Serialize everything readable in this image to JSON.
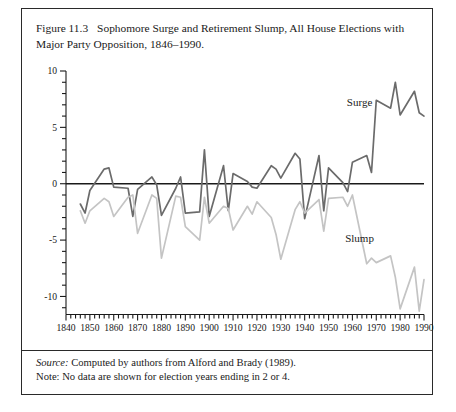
{
  "figure": {
    "number": "Figure 11.3",
    "caption": "Sophomore Surge and Retirement Slump, All House Elections with Major Party Opposition, 1846–1990."
  },
  "footer": {
    "source_word": "Source:",
    "source_text": " Computed by authors from Alford and Brady (1989).",
    "note_text": "Note: No data are shown for election years ending in 2 or 4."
  },
  "chart_data": {
    "type": "line",
    "title": "Sophomore Surge and Retirement Slump, All House Elections with Major Party Opposition, 1846–1990.",
    "xlabel": "",
    "ylabel": "",
    "xlim": [
      1840,
      1990
    ],
    "ylim": [
      -12,
      10
    ],
    "grid": false,
    "legend": "inline-annotation",
    "zero_line": true,
    "y_ticks": [
      -10,
      -5,
      0,
      5,
      10
    ],
    "y_tick_labels": [
      "-10",
      "-5",
      "0",
      "5",
      "10"
    ],
    "y_minor_step": 1,
    "x_ticks": [
      1840,
      1850,
      1860,
      1870,
      1880,
      1890,
      1900,
      1910,
      1920,
      1930,
      1940,
      1950,
      1960,
      1970,
      1980,
      1990
    ],
    "x_tick_labels": [
      "1840",
      "1850",
      "1860",
      "1870",
      "1880",
      "1890",
      "1900",
      "1910",
      "1920",
      "1930",
      "1940",
      "1950",
      "1960",
      "1970",
      "1980",
      "1990"
    ],
    "x_minor_step": 2,
    "colors": {
      "surge": "#6b6b6b",
      "slump": "#c4c4c4",
      "axis": "#1a1a1a"
    },
    "annotations": [
      {
        "text": "Surge",
        "x": 1963,
        "y": 6.9
      },
      {
        "text": "Slump",
        "x": 1963,
        "y": -5.2
      }
    ],
    "x": [
      1846,
      1848,
      1850,
      1856,
      1858,
      1860,
      1866,
      1868,
      1870,
      1876,
      1878,
      1880,
      1886,
      1888,
      1890,
      1896,
      1898,
      1900,
      1906,
      1908,
      1910,
      1916,
      1918,
      1920,
      1926,
      1928,
      1930,
      1936,
      1938,
      1940,
      1946,
      1948,
      1950,
      1956,
      1958,
      1960,
      1966,
      1968,
      1970,
      1976,
      1978,
      1980,
      1986,
      1988,
      1990
    ],
    "series": [
      {
        "name": "Surge",
        "color": "#6b6b6b",
        "values": [
          -1.8,
          -2.6,
          -0.6,
          1.3,
          1.4,
          -0.3,
          -0.4,
          -2.9,
          -0.5,
          0.6,
          -0.1,
          -2.8,
          -0.4,
          0.6,
          -2.6,
          -2.5,
          3.0,
          -2.9,
          1.6,
          -2.4,
          0.9,
          0.2,
          -0.3,
          -0.4,
          1.6,
          1.3,
          0.5,
          2.7,
          2.2,
          -3.1,
          2.5,
          -2.4,
          1.4,
          0.1,
          -0.7,
          1.9,
          2.5,
          1.0,
          7.4,
          6.7,
          9.0,
          6.1,
          8.2,
          6.3,
          6.0
        ]
      },
      {
        "name": "Slump",
        "color": "#c4c4c4",
        "values": [
          -2.4,
          -3.5,
          -2.4,
          -1.3,
          -1.6,
          -2.9,
          -1.2,
          -1.0,
          -4.4,
          -1.0,
          -1.3,
          -6.6,
          -1.1,
          -1.2,
          -3.8,
          -5.0,
          -1.2,
          -3.5,
          -2.0,
          -2.2,
          -4.1,
          -2.0,
          -2.7,
          -1.6,
          -3.0,
          -4.5,
          -6.7,
          -2.3,
          -1.6,
          -2.6,
          -1.4,
          -4.2,
          -1.3,
          -1.2,
          -2.0,
          -1.0,
          -7.1,
          -6.6,
          -7.0,
          -6.4,
          -8.3,
          -11.1,
          -7.4,
          -11.3,
          -8.5
        ]
      }
    ]
  }
}
